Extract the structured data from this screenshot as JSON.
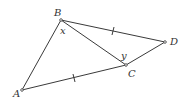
{
  "figure": {
    "type": "geometry-diagram",
    "points": {
      "A": {
        "label": "A",
        "x": 22,
        "y": 90,
        "label_x": 13,
        "label_y": 97
      },
      "B": {
        "label": "B",
        "x": 61,
        "y": 20,
        "label_x": 54,
        "label_y": 16
      },
      "C": {
        "label": "C",
        "x": 126,
        "y": 65,
        "label_x": 128,
        "label_y": 77
      },
      "D": {
        "label": "D",
        "x": 165,
        "y": 42,
        "label_x": 170,
        "label_y": 45
      }
    },
    "segments": [
      "AB",
      "BD",
      "BC",
      "CD",
      "AC"
    ],
    "congruence_marks": [
      {
        "segment": "BD",
        "ticks": 1
      },
      {
        "segment": "AC",
        "ticks": 1
      }
    ],
    "angle_labels": {
      "x": {
        "label": "x",
        "vertex": "B",
        "x": 60,
        "y": 34
      },
      "y": {
        "label": "y",
        "vertex": "C",
        "x": 121,
        "y": 59
      }
    }
  }
}
